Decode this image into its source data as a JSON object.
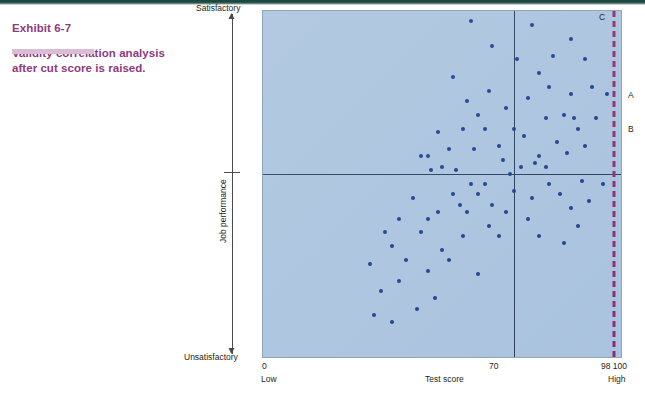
{
  "caption": {
    "exhibit_label": "Exhibit 6-7",
    "title": "Validity correlation analysis after cut score is raised."
  },
  "colors": {
    "accent_purple": "#8e3a7b",
    "underline_lavender": "#d9bcd6",
    "plot_fill": "#aac3de",
    "dot": "#1c3f8f",
    "cut_line_dashed": "#8e2f6f",
    "divider": "#2b3f5c",
    "top_rule": "#1f4741"
  },
  "axes": {
    "y_top_label": "Satisfactory",
    "y_bottom_label": "Unsatisfactory",
    "y_title": "Job performance",
    "x_title": "Test score",
    "x_ticks": [
      {
        "value": "0",
        "sublabel": "Low"
      },
      {
        "value": "70",
        "sublabel": ""
      },
      {
        "value": "98 100",
        "sublabel": "High"
      }
    ]
  },
  "annotations": [
    {
      "name": "point-label-a",
      "text": "A"
    },
    {
      "name": "point-label-b",
      "text": "B"
    },
    {
      "name": "point-label-c",
      "text": "C"
    }
  ],
  "chart_data": {
    "type": "scatter",
    "title": "Validity correlation analysis after cut score is raised.",
    "xlabel": "Test score",
    "ylabel": "Job performance",
    "xlim": [
      0,
      100
    ],
    "ylim": [
      0,
      100
    ],
    "x_tick_values": [
      0,
      70,
      98,
      100
    ],
    "x_tick_labels": [
      "0 / Low",
      "70",
      "98",
      "100 / High"
    ],
    "y_tick_labels": [
      "Unsatisfactory",
      "Satisfactory"
    ],
    "grid": false,
    "legend": null,
    "reference_lines": [
      {
        "name": "old-cut-score",
        "orientation": "vertical",
        "value": 70,
        "style": "solid",
        "color": "#2b3f5c"
      },
      {
        "name": "performance-threshold",
        "orientation": "horizontal",
        "value": 53,
        "style": "solid",
        "color": "#2b3f5c"
      },
      {
        "name": "raised-cut-score",
        "orientation": "vertical",
        "value": 98,
        "style": "dashed",
        "color": "#8e2f6f"
      }
    ],
    "point_color": "#1c3f8f",
    "points": [
      [
        58,
        97
      ],
      [
        75,
        96
      ],
      [
        81,
        87
      ],
      [
        86,
        92
      ],
      [
        71,
        86
      ],
      [
        90,
        86
      ],
      [
        64,
        90
      ],
      [
        77,
        82
      ],
      [
        63,
        77
      ],
      [
        80,
        78
      ],
      [
        92,
        78
      ],
      [
        68,
        72
      ],
      [
        86,
        76
      ],
      [
        96,
        76
      ],
      [
        74,
        75
      ],
      [
        53,
        81
      ],
      [
        57,
        74
      ],
      [
        79,
        69
      ],
      [
        60,
        70
      ],
      [
        84,
        70
      ],
      [
        87,
        69
      ],
      [
        88,
        66
      ],
      [
        93,
        69
      ],
      [
        56,
        66
      ],
      [
        62,
        66
      ],
      [
        70,
        66
      ],
      [
        49,
        65
      ],
      [
        73,
        64
      ],
      [
        82,
        62
      ],
      [
        66,
        61
      ],
      [
        90,
        61
      ],
      [
        52,
        60
      ],
      [
        59,
        60
      ],
      [
        85,
        59
      ],
      [
        44,
        58
      ],
      [
        46,
        58
      ],
      [
        77,
        58
      ],
      [
        67,
        57
      ],
      [
        76,
        56
      ],
      [
        79,
        55
      ],
      [
        50,
        55
      ],
      [
        72,
        55
      ],
      [
        54,
        54
      ],
      [
        47,
        54
      ],
      [
        69,
        53
      ],
      [
        89,
        51
      ],
      [
        62,
        50
      ],
      [
        80,
        50
      ],
      [
        58,
        50
      ],
      [
        95,
        50
      ],
      [
        70,
        48
      ],
      [
        53,
        47
      ],
      [
        83,
        47
      ],
      [
        60,
        47
      ],
      [
        75,
        46
      ],
      [
        42,
        46
      ],
      [
        91,
        45
      ],
      [
        55,
        44
      ],
      [
        64,
        44
      ],
      [
        86,
        43
      ],
      [
        49,
        42
      ],
      [
        57,
        42
      ],
      [
        68,
        42
      ],
      [
        38,
        40
      ],
      [
        46,
        40
      ],
      [
        74,
        40
      ],
      [
        63,
        38
      ],
      [
        88,
        38
      ],
      [
        34,
        36
      ],
      [
        44,
        36
      ],
      [
        56,
        35
      ],
      [
        66,
        35
      ],
      [
        77,
        35
      ],
      [
        36,
        32
      ],
      [
        50,
        31
      ],
      [
        40,
        28
      ],
      [
        52,
        28
      ],
      [
        30,
        27
      ],
      [
        46,
        25
      ],
      [
        60,
        24
      ],
      [
        38,
        22
      ],
      [
        33,
        19
      ],
      [
        48,
        17
      ],
      [
        43,
        14
      ],
      [
        31,
        12
      ],
      [
        36,
        10
      ],
      [
        84,
        33
      ]
    ]
  }
}
